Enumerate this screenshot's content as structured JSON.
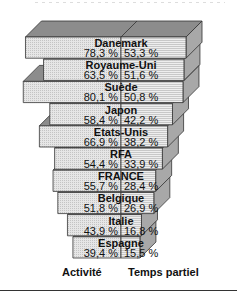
{
  "chart_data": {
    "type": "bar",
    "orientation": "horizontal-back-to-back-3d",
    "title": "",
    "categories": [
      "Danemark",
      "Royaume-Uni",
      "Suède",
      "Japon",
      "Etats-Unis",
      "RFA",
      "FRANCE",
      "Belgique",
      "Italie",
      "Espagne"
    ],
    "series": [
      {
        "name": "Activité",
        "values": [
          78.3,
          63.5,
          80.1,
          58.4,
          66.9,
          54.4,
          55.7,
          51.8,
          43.9,
          39.4
        ]
      },
      {
        "name": "Temps partiel",
        "values": [
          53.3,
          51.6,
          50.8,
          42.2,
          38.2,
          33.9,
          28.4,
          26.9,
          16.8,
          15.5
        ]
      }
    ],
    "value_labels": {
      "activite": [
        "78,3 %",
        "63,5 %",
        "80,1 %",
        "58,4 %",
        "66,9 %",
        "54,4 %",
        "55,7 %",
        "51,8 %",
        "43,9 %",
        "39,4 %"
      ],
      "temps_partiel": [
        "53,3 %",
        "51,6 %",
        "50,8 %",
        "42,2 %",
        "38,2 %",
        "33,9 %",
        "28,4 %",
        "26,9 %",
        "16,8 %",
        "15,5 %"
      ]
    },
    "xlabel_left": "Activité",
    "xlabel_right": "Temps partiel",
    "grid": false,
    "legend": "none",
    "colors": {
      "front_left": "#e6e6e6",
      "front_right": "#dcdcdc",
      "top": "#8c8c8c",
      "side": "#a8a8a8",
      "edge": "#333333"
    }
  },
  "axis": {
    "left_label": "Activité",
    "right_label": "Temps partiel"
  }
}
